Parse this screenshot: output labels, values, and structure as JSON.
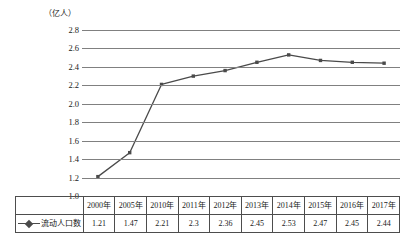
{
  "chart_data": {
    "type": "line",
    "title": "",
    "unit_label": "（亿人）",
    "ylabel": "",
    "xlabel": "",
    "ylim": [
      1.0,
      2.8
    ],
    "ytick_step": 0.2,
    "yticks": [
      "2.8",
      "2.6",
      "2.4",
      "2.2",
      "2.0",
      "1.8",
      "1.6",
      "1.4",
      "1.2",
      "1.0"
    ],
    "grid": true,
    "legend_position": "table-left",
    "categories": [
      "2000年",
      "2005年",
      "2010年",
      "2011年",
      "2012年",
      "2013年",
      "2014年",
      "2015年",
      "2016年",
      "2017年"
    ],
    "series": [
      {
        "name": "流动人口数",
        "values": [
          1.21,
          1.47,
          2.21,
          2.3,
          2.36,
          2.45,
          2.53,
          2.47,
          2.45,
          2.44
        ],
        "labels": [
          "1.21",
          "1.47",
          "2.21",
          "2.3",
          "2.36",
          "2.45",
          "2.53",
          "2.47",
          "2.45",
          "2.44"
        ],
        "color": "#4a4a4a",
        "marker": "square"
      }
    ]
  },
  "colors": {
    "series_line": "#4a4a4a",
    "gridline": "#808080",
    "table_border": "#4d4d4d",
    "text": "#1a1a1a",
    "background": "#ffffff"
  },
  "table": {
    "legend_label": "流动人口数",
    "header_row": [
      "2000年",
      "2005年",
      "2010年",
      "2011年",
      "2012年",
      "2013年",
      "2014年",
      "2015年",
      "2016年",
      "2017年"
    ],
    "value_row": [
      "1.21",
      "1.47",
      "2.21",
      "2.3",
      "2.36",
      "2.45",
      "2.53",
      "2.47",
      "2.45",
      "2.44"
    ]
  }
}
